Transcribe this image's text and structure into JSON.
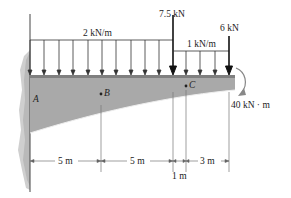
{
  "diagram": {
    "type": "cantilever-beam",
    "support": "fixed wall at A (left)",
    "loads": {
      "distributed_left": "2 kN/m",
      "point_load_1": "7.5 kN",
      "distributed_right": "1 kN/m",
      "point_load_end": "6 kN",
      "end_moment": "40 kN · m"
    },
    "points": {
      "a": "A",
      "b": "B",
      "c": "C"
    },
    "dimensions": {
      "seg1": "5 m",
      "seg2": "5 m",
      "seg3": "1 m",
      "seg4": "3 m"
    },
    "colors": {
      "beam_fill": "#a9a9a9",
      "beam_top": "#8c8c8c",
      "wall": "#c8c8c8",
      "line": "#333333"
    }
  }
}
